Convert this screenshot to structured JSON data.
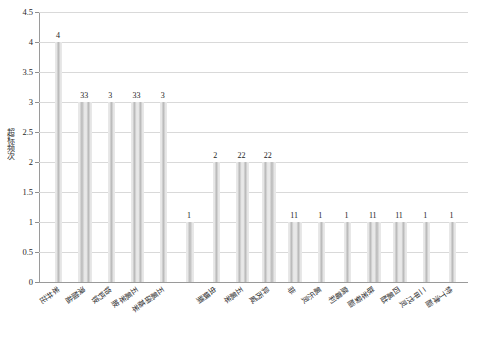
{
  "chart_data": {
    "type": "bar",
    "title": "",
    "subtitle": "",
    "xlabel": "",
    "ylabel": "超标频次",
    "ylim": [
      0,
      4.5
    ],
    "yticks": [
      "0",
      "0.5",
      "1",
      "1.5",
      "2",
      "2.5",
      "3",
      "3.5",
      "4",
      "4.5"
    ],
    "ytick_values": [
      0,
      0.5,
      1,
      1.5,
      2,
      2.5,
      3,
      3.5,
      4,
      4.5
    ],
    "grid": true,
    "legend": "none",
    "categories": [
      "苯并芘",
      "溴酸盐",
      "铬钙铵",
      "五氯苯胺",
      "五氯硝基苯",
      "虫螨腈",
      "五氯苯",
      "异丙威",
      "菲",
      "氯乐灵",
      "腐霉利",
      "联苯菊酯",
      "四氯酞",
      "二甲戊灵",
      "特丁津酯"
    ],
    "bars": [
      {
        "label": "苯并芘",
        "value": 4,
        "display": "4"
      },
      {
        "label": "溴酸盐",
        "value": 3,
        "display": "33"
      },
      {
        "label": "铬钙铵",
        "value": 3,
        "display": "3"
      },
      {
        "label": "五氯苯胺",
        "value": 3,
        "display": "33"
      },
      {
        "label": "五氯硝基苯",
        "value": 3,
        "display": "3"
      },
      {
        "label": "五氯硝基苯b",
        "value": 1,
        "display": "1"
      },
      {
        "label": "虫螨腈",
        "value": 2,
        "display": "2"
      },
      {
        "label": "五氯苯",
        "value": 2,
        "display": "22"
      },
      {
        "label": "异丙威",
        "value": 2,
        "display": "22"
      },
      {
        "label": "菲",
        "value": 1,
        "display": "11"
      },
      {
        "label": "氯乐灵",
        "value": 1,
        "display": "1"
      },
      {
        "label": "腐霉利",
        "value": 1,
        "display": "1"
      },
      {
        "label": "联苯菊酯",
        "value": 1,
        "display": "11"
      },
      {
        "label": "四氯酞",
        "value": 1,
        "display": "11"
      },
      {
        "label": "二甲戊灵",
        "value": 1,
        "display": "1"
      },
      {
        "label": "特丁津酯",
        "value": 1,
        "display": "1"
      }
    ],
    "value_labels": [
      "4",
      "33",
      "3",
      "33",
      "3",
      "1",
      "2",
      "22",
      "22",
      "11",
      "1",
      "1",
      "11",
      "11",
      "1",
      "1"
    ],
    "colors": {
      "bar_fill_light": "#f2f2f2",
      "bar_fill_mid": "#b9b9b9",
      "grid": "#d9d9d9",
      "axis": "#9a9a9a",
      "text": "#1f1f1f",
      "background": "#ffffff"
    }
  },
  "axis": {
    "y_title": "超标频次",
    "ticks": [
      {
        "label": "4.5",
        "value": 4.5
      },
      {
        "label": "4",
        "value": 4
      },
      {
        "label": "3.5",
        "value": 3.5
      },
      {
        "label": "3",
        "value": 3
      },
      {
        "label": "2.5",
        "value": 2.5
      },
      {
        "label": "2",
        "value": 2
      },
      {
        "label": "1.5",
        "value": 1.5
      },
      {
        "label": "1",
        "value": 1
      },
      {
        "label": "0.5",
        "value": 0.5
      },
      {
        "label": "0",
        "value": 0
      }
    ]
  },
  "x_categories": [
    {
      "label": "苯并芘"
    },
    {
      "label": "溴酸盐"
    },
    {
      "label": "铬钙铵"
    },
    {
      "label": "五氯苯胺"
    },
    {
      "label": "五氯硝基苯"
    },
    {
      "label": "虫螨腈"
    },
    {
      "label": "五氯苯"
    },
    {
      "label": "异丙威"
    },
    {
      "label": "菲"
    },
    {
      "label": "氯乐灵"
    },
    {
      "label": "腐霉利"
    },
    {
      "label": "联苯菊酯"
    },
    {
      "label": "四氯酞"
    },
    {
      "label": "二甲戊灵"
    },
    {
      "label": "特丁津酯"
    }
  ]
}
